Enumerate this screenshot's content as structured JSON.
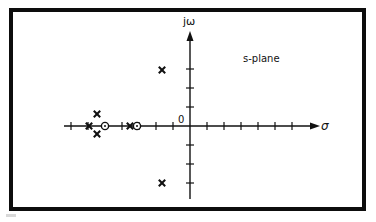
{
  "figure": {
    "plane_label": "s-plane",
    "x_axis_label": "σ",
    "y_axis_label": "jω",
    "origin_label": "0",
    "colors": {
      "ink": "#111111",
      "background": "#ffffff",
      "frame": "#0d0d0d"
    }
  },
  "diagram": {
    "type": "pole-zero plot",
    "frame": {
      "x": 11,
      "y": 10,
      "width": 353,
      "height": 199,
      "stroke_width": 4
    },
    "origin_px": {
      "x": 190,
      "y": 126
    },
    "x_tick_spacing_px": 17,
    "y_tick_spacing_px": 19,
    "x_ticks": [
      -7,
      -6,
      -5,
      -4,
      -3,
      -2,
      -1,
      1,
      2,
      3,
      4,
      5,
      6
    ],
    "y_ticks": [
      -3,
      -2,
      -1,
      1,
      2,
      3
    ],
    "poles": [
      {
        "label": "X",
        "x_px": 89,
        "y_px": 126
      },
      {
        "label": "X",
        "x_px": 97,
        "y_px": 114
      },
      {
        "label": "X",
        "x_px": 97,
        "y_px": 134
      },
      {
        "label": "X",
        "x_px": 130,
        "y_px": 126
      },
      {
        "label": "X",
        "x_px": 162,
        "y_px": 70
      },
      {
        "label": "X",
        "x_px": 162,
        "y_px": 183
      }
    ],
    "zeros": [
      {
        "x_px": 105,
        "y_px": 126
      },
      {
        "x_px": 137,
        "y_px": 126
      }
    ]
  }
}
